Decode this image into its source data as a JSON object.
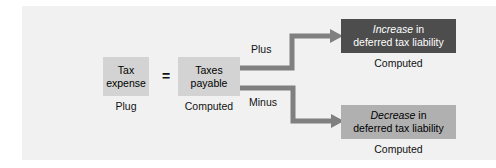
{
  "diagram": {
    "colors": {
      "panel_background": "#f1f1f1",
      "page_background": "#ffffff",
      "box_light": "#d3d3d3",
      "box_dark": "#4d4d4d",
      "box_mid": "#b0b0b0",
      "connector": "#808080",
      "text_dark": "#111111",
      "text_light": "#ffffff"
    },
    "nodes": {
      "tax_expense": {
        "line1": "Tax",
        "line2": "expense",
        "caption": "Plug"
      },
      "taxes_payable": {
        "line1": "Taxes",
        "line2": "payable",
        "caption": "Computed"
      },
      "increase": {
        "emphasis": "Increase",
        "line1_rest": " in",
        "line2": "deferred tax liability",
        "caption": "Computed"
      },
      "decrease": {
        "emphasis": "Decrease",
        "line1_rest": " in",
        "line2": "deferred tax liability",
        "caption": "Computed"
      }
    },
    "operators": {
      "equals": "=",
      "plus": "Plus",
      "minus": "Minus"
    },
    "connectors": [
      {
        "name": "plus-connector",
        "from": "taxes_payable",
        "to": "increase",
        "label": "Plus",
        "shape": "elbow-up-right"
      },
      {
        "name": "minus-connector",
        "from": "taxes_payable",
        "to": "decrease",
        "label": "Minus",
        "shape": "elbow-down-right"
      }
    ]
  }
}
